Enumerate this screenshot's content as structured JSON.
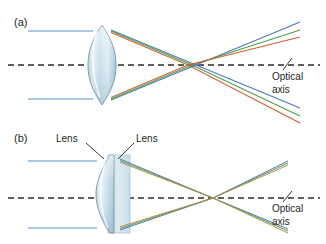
{
  "figure": {
    "width": 326,
    "height": 244,
    "background": "#ffffff",
    "panels": [
      {
        "id": "a",
        "label": "(a)",
        "label_pos": {
          "x": 14,
          "y": 26
        },
        "description": "Single biconvex lens showing chromatic aberration: blue, green and red rays focus at different points along the optical axis.",
        "optical_axis": {
          "label_line1": "Optical",
          "label_line2": "axis",
          "label_pos": {
            "x": 272,
            "y": 80
          },
          "y": 65,
          "x_start": 8,
          "x_end": 320,
          "dash": "6,4",
          "color": "#2b2b2b",
          "leader": {
            "x1": 283,
            "y1": 70,
            "x2": 292,
            "y2": 58
          }
        },
        "lens": {
          "type": "biconvex",
          "x_center": 102,
          "x_left": 88,
          "x_right": 116,
          "y_top": 25,
          "y_bottom": 105,
          "fill_light": "#f2f8fb",
          "fill_mid": "#cfe2ec",
          "fill_dark": "#9dbccd",
          "edge": "#5b7a8c"
        },
        "incoming_rays": [
          {
            "color": "#5b8fc9",
            "y": 31,
            "x_start": 28,
            "x_end": 93
          },
          {
            "color": "#5b8fc9",
            "y": 99,
            "x_start": 28,
            "x_end": 93
          }
        ],
        "refracted_rays": [
          {
            "color": "#4f79bc",
            "name": "blue-upper",
            "x1": 111,
            "y1": 30,
            "x2": 196,
            "y2": 65,
            "x3": 300,
            "y3": 108
          },
          {
            "color": "#4f9e52",
            "name": "green-upper",
            "x1": 111,
            "y1": 31,
            "x2": 192,
            "y2": 65,
            "x3": 300,
            "y3": 115
          },
          {
            "color": "#d4602f",
            "name": "red-upper",
            "x1": 111,
            "y1": 32,
            "x2": 188,
            "y2": 65,
            "x3": 300,
            "y3": 122
          },
          {
            "color": "#4f79bc",
            "name": "blue-lower",
            "x1": 111,
            "y1": 100,
            "x2": 196,
            "y2": 65,
            "x3": 300,
            "y3": 30
          },
          {
            "color": "#4f9e52",
            "name": "green-lower",
            "x1": 111,
            "y1": 99,
            "x2": 192,
            "y2": 65,
            "x3": 300,
            "y3": 37
          },
          {
            "color": "#d4602f",
            "name": "red-lower",
            "x1": 111,
            "y1": 98,
            "x2": 188,
            "y2": 65,
            "x3": 300,
            "y3": 44
          }
        ]
      },
      {
        "id": "b",
        "label": "(b)",
        "label_pos": {
          "x": 14,
          "y": 142
        },
        "description": "Achromatic doublet: two cemented lens elements bring all colors to a common focus on the optical axis.",
        "optical_axis": {
          "label_line1": "Optical",
          "label_line2": "axis",
          "label_pos": {
            "x": 272,
            "y": 210
          },
          "y": 198,
          "x_start": 8,
          "x_end": 320,
          "dash": "6,4",
          "color": "#2b2b2b",
          "leader": {
            "x1": 283,
            "y1": 200,
            "x2": 292,
            "y2": 190
          }
        },
        "lens_labels": [
          {
            "text": "Lens",
            "x": 56,
            "y": 140,
            "leader": {
              "x1": 86,
              "y1": 142,
              "x2": 103,
              "y2": 158
            }
          },
          {
            "text": "Lens",
            "x": 136,
            "y": 140,
            "leader": {
              "x1": 134,
              "y1": 142,
              "x2": 118,
              "y2": 158
            }
          }
        ],
        "doublet": {
          "front": {
            "type": "plano-convex",
            "x_left": 88,
            "x_right": 114,
            "y_top": 155,
            "y_bottom": 233,
            "fill_light": "#f4fafc",
            "fill_mid": "#d2e6ef",
            "fill_dark": "#a7c6d6",
            "edge": "#6a8a9c"
          },
          "rear": {
            "type": "block",
            "x_left": 108,
            "x_right": 130,
            "y_top": 155,
            "y_bottom": 233,
            "fill": "#d9e9f0",
            "edge": "#9fc0cf"
          }
        },
        "incoming_rays": [
          {
            "color": "#5b8fc9",
            "y": 161,
            "x_start": 28,
            "x_end": 95
          },
          {
            "color": "#5b8fc9",
            "y": 228,
            "x_start": 28,
            "x_end": 95
          }
        ],
        "refracted_rays": [
          {
            "color": "#4f79bc",
            "name": "blue-upper",
            "x1": 120,
            "y1": 160,
            "x2": 213,
            "y2": 198,
            "x3": 288,
            "y3": 228,
            "offset": 0
          },
          {
            "color": "#4f9e52",
            "name": "green-upper",
            "x1": 120,
            "y1": 161,
            "x2": 213,
            "y2": 198,
            "x3": 288,
            "y3": 230,
            "offset": 1
          },
          {
            "color": "#c28b4a",
            "name": "amber-upper",
            "x1": 120,
            "y1": 162,
            "x2": 213,
            "y2": 198,
            "x3": 288,
            "y3": 232,
            "offset": 2
          },
          {
            "color": "#4f79bc",
            "name": "blue-lower",
            "x1": 120,
            "y1": 229,
            "x2": 213,
            "y2": 198,
            "x3": 288,
            "y3": 162,
            "offset": 0
          },
          {
            "color": "#4f9e52",
            "name": "green-lower",
            "x1": 120,
            "y1": 228,
            "x2": 213,
            "y2": 198,
            "x3": 288,
            "y3": 164,
            "offset": 1
          },
          {
            "color": "#c28b4a",
            "name": "amber-lower",
            "x1": 120,
            "y1": 227,
            "x2": 213,
            "y2": 198,
            "x3": 288,
            "y3": 166,
            "offset": 2
          }
        ],
        "focus_point": {
          "x": 213,
          "y": 198
        }
      }
    ],
    "colors": {
      "ray_blue": "#4f79bc",
      "ray_green": "#4f9e52",
      "ray_red": "#d4602f",
      "ray_amber": "#c28b4a",
      "incoming_blue": "#5b8fc9",
      "axis": "#2b2b2b",
      "text": "#231f20",
      "glass_light": "#f2f8fb",
      "glass_mid": "#cfe2ec",
      "glass_dark": "#9dbccd",
      "glass_edge": "#5b7a8c"
    }
  }
}
